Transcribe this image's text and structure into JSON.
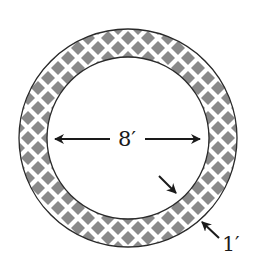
{
  "diagram": {
    "inner_diameter_label": "8′",
    "ring_width_label": "1′",
    "colors": {
      "stroke": "#2a2a2a",
      "pattern": "#8a8a8a",
      "background": "#ffffff"
    },
    "geometry": {
      "center_x": 128,
      "center_y": 138,
      "outer_radius": 109,
      "inner_radius": 81
    }
  }
}
